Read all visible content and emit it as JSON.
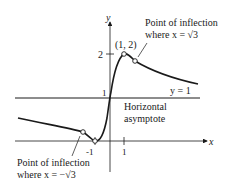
{
  "diagram": {
    "type": "function-graph",
    "axes": {
      "x_label": "x",
      "y_label": "y",
      "x_ticks": [
        "-1",
        "1"
      ],
      "y_ticks": [
        "1",
        "2"
      ]
    },
    "asymptote": {
      "equation_label": "y = 1",
      "description_line1": "Horizontal",
      "description_line2": "asymptote"
    },
    "points": {
      "maximum": {
        "label": "(1, 2)",
        "x": 1,
        "y": 2
      },
      "inflection_right": {
        "title": "Point of inflection",
        "condition": "where x = √3"
      },
      "inflection_left": {
        "title": "Point of inflection",
        "condition": "where x = −√3"
      }
    },
    "colors": {
      "ink": "#1a1a1a",
      "background": "#ffffff"
    }
  }
}
